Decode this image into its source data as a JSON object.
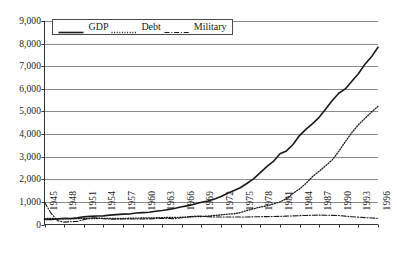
{
  "chart_data": {
    "type": "line",
    "title": "",
    "subtitle": "",
    "xlabel": "",
    "ylabel": "",
    "grid": true,
    "legend_position": "top-left-inside",
    "xlim": [
      1945,
      1996
    ],
    "ylim": [
      0,
      9000
    ],
    "yticks": [
      "0",
      "1,000",
      "2,000",
      "3,000",
      "4,000",
      "5,000",
      "6,000",
      "7,000",
      "8,000",
      "9,000"
    ],
    "ytick_values": [
      0,
      1000,
      2000,
      3000,
      4000,
      5000,
      6000,
      7000,
      8000,
      9000
    ],
    "xticks": [
      "1945",
      "1948",
      "1951",
      "1954",
      "1957",
      "1960",
      "1963",
      "1966",
      "1969",
      "1972",
      "1975",
      "1978",
      "1981",
      "1984",
      "1987",
      "1990",
      "1993",
      "1996"
    ],
    "xtick_values": [
      1945,
      1948,
      1951,
      1954,
      1957,
      1960,
      1963,
      1966,
      1969,
      1972,
      1975,
      1978,
      1981,
      1984,
      1987,
      1990,
      1993,
      1996
    ],
    "x": [
      1945,
      1946,
      1947,
      1948,
      1949,
      1950,
      1951,
      1952,
      1953,
      1954,
      1955,
      1956,
      1957,
      1958,
      1959,
      1960,
      1961,
      1962,
      1963,
      1964,
      1965,
      1966,
      1967,
      1968,
      1969,
      1970,
      1971,
      1972,
      1973,
      1974,
      1975,
      1976,
      1977,
      1978,
      1979,
      1980,
      1981,
      1982,
      1983,
      1984,
      1985,
      1986,
      1987,
      1988,
      1989,
      1990,
      1991,
      1992,
      1993,
      1994,
      1995,
      1996
    ],
    "series": [
      {
        "name": "GDP",
        "style": "solid",
        "color": "#1a1a1a",
        "values": [
          223,
          222,
          244,
          269,
          267,
          294,
          339,
          358,
          379,
          380,
          415,
          438,
          461,
          467,
          507,
          527,
          545,
          586,
          618,
          664,
          719,
          788,
          833,
          910,
          985,
          1039,
          1128,
          1240,
          1385,
          1501,
          1635,
          1824,
          2031,
          2295,
          2563,
          2790,
          3128,
          3255,
          3537,
          3933,
          4220,
          4463,
          4739,
          5104,
          5484,
          5803,
          5996,
          6338,
          6667,
          7085,
          7415,
          7839
        ]
      },
      {
        "name": "Debt",
        "style": "dotted",
        "color": "#1a1a1a",
        "values": [
          260,
          271,
          257,
          252,
          253,
          257,
          255,
          259,
          266,
          271,
          274,
          273,
          271,
          276,
          285,
          287,
          289,
          298,
          306,
          312,
          317,
          320,
          326,
          348,
          354,
          371,
          398,
          427,
          458,
          475,
          533,
          620,
          699,
          772,
          827,
          908,
          998,
          1142,
          1377,
          1572,
          1823,
          2125,
          2350,
          2602,
          2857,
          3233,
          3665,
          4065,
          4411,
          4693,
          4974,
          5225
        ]
      },
      {
        "name": "Military",
        "style": "dashdot",
        "color": "#1a1a1a",
        "values": [
          985,
          500,
          170,
          105,
          120,
          135,
          215,
          290,
          300,
          260,
          240,
          235,
          240,
          240,
          245,
          245,
          250,
          265,
          270,
          265,
          260,
          300,
          345,
          370,
          365,
          345,
          330,
          330,
          330,
          330,
          335,
          335,
          340,
          345,
          350,
          355,
          360,
          370,
          380,
          390,
          400,
          410,
          415,
          410,
          405,
          395,
          370,
          345,
          325,
          305,
          290,
          275
        ]
      }
    ]
  },
  "legend": {
    "items": [
      {
        "label": "GDP",
        "style": "solid"
      },
      {
        "label": "Debt",
        "style": "dotted"
      },
      {
        "label": "Military",
        "style": "dashdot"
      }
    ]
  },
  "axes": {
    "y_labels": [
      "9,000",
      "8,000",
      "7,000",
      "6,000",
      "5,000",
      "4,000",
      "3,000",
      "2,000",
      "1,000",
      "0"
    ],
    "x_labels": [
      "1945",
      "1948",
      "1951",
      "1954",
      "1957",
      "1960",
      "1963",
      "1966",
      "1969",
      "1972",
      "1975",
      "1978",
      "1981",
      "1984",
      "1987",
      "1990",
      "1993",
      "1996"
    ]
  },
  "colors": {
    "line": "#1a1a1a",
    "grid": "#8c8c8c",
    "axis": "#333333",
    "background": "#ffffff"
  }
}
